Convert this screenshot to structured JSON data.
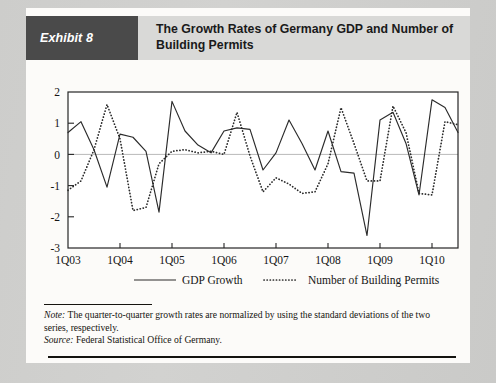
{
  "exhibit": {
    "badge_label": "Exhibit 8",
    "title": "The Growth Rates of Germany GDP and Number of Building Permits"
  },
  "footnote": {
    "note_label": "Note:",
    "note_text": " The quarter-to-quarter growth rates are normalized by using the standard deviations of the two series, respectively.",
    "source_label": "Source:",
    "source_text": " Federal Statistical Office of Germany."
  },
  "chart_data": {
    "type": "line",
    "title": "The Growth Rates of Germany GDP and Number of Building Permits",
    "xlabel": "",
    "ylabel": "",
    "ylim": [
      -3,
      2
    ],
    "yticks": [
      2,
      1,
      0,
      -1,
      -2,
      -3
    ],
    "ytick_labels": [
      "2",
      "1",
      "0",
      "-1",
      "-2",
      "-3"
    ],
    "grid": false,
    "zero_line": true,
    "legend_position": "below",
    "x_tick_labels": [
      "1Q03",
      "1Q04",
      "1Q05",
      "1Q06",
      "1Q07",
      "1Q08",
      "1Q09",
      "1Q10"
    ],
    "x_tick_indices": [
      0,
      4,
      8,
      12,
      16,
      20,
      24,
      28
    ],
    "x": [
      "1Q03",
      "2Q03",
      "3Q03",
      "4Q03",
      "1Q04",
      "2Q04",
      "3Q04",
      "4Q04",
      "1Q05",
      "2Q05",
      "3Q05",
      "4Q05",
      "1Q06",
      "2Q06",
      "3Q06",
      "4Q06",
      "1Q07",
      "2Q07",
      "3Q07",
      "4Q07",
      "1Q08",
      "2Q08",
      "3Q08",
      "4Q08",
      "1Q09",
      "2Q09",
      "3Q09",
      "4Q09",
      "1Q10",
      "2Q10",
      "3Q10"
    ],
    "series": [
      {
        "name": "GDP Growth",
        "style": "solid",
        "color": "#2b2b2b",
        "values": [
          0.7,
          1.05,
          0.15,
          -1.05,
          0.65,
          0.55,
          0.1,
          -1.85,
          1.7,
          0.75,
          0.3,
          0.05,
          0.75,
          0.85,
          0.8,
          -0.5,
          0.05,
          1.1,
          0.35,
          -0.5,
          0.75,
          -0.55,
          -0.6,
          -2.6,
          1.1,
          1.35,
          0.35,
          -1.3,
          1.75,
          1.5,
          0.7
        ]
      },
      {
        "name": "Number of Building Permits",
        "style": "dotted",
        "color": "#2b2b2b",
        "values": [
          -1.15,
          -0.85,
          0.15,
          1.6,
          0.5,
          -1.8,
          -1.7,
          -0.3,
          0.1,
          0.15,
          0.05,
          0.1,
          0.0,
          1.35,
          -0.05,
          -1.2,
          -0.75,
          -0.95,
          -1.25,
          -1.2,
          -0.3,
          1.5,
          0.35,
          -0.85,
          -0.85,
          1.55,
          0.7,
          -1.25,
          -1.3,
          1.05,
          0.95
        ]
      }
    ]
  }
}
